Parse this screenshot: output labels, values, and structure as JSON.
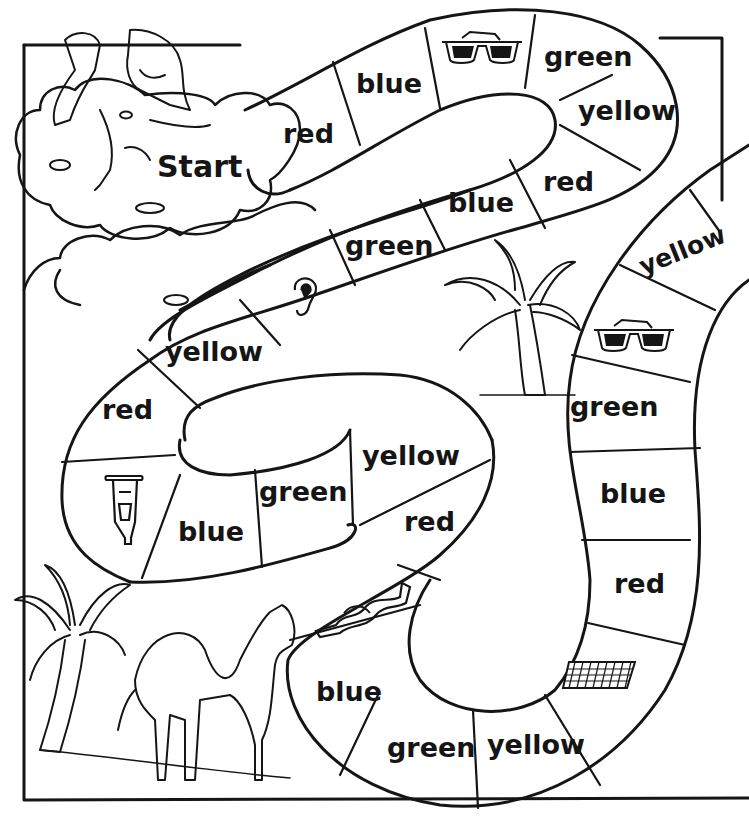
{
  "start_label": "Start",
  "spaces": [
    {
      "index": 1,
      "type": "color",
      "label": "red"
    },
    {
      "index": 2,
      "type": "color",
      "label": "blue"
    },
    {
      "index": 3,
      "type": "picture",
      "icon": "sunglasses-icon"
    },
    {
      "index": 4,
      "type": "color",
      "label": "green"
    },
    {
      "index": 5,
      "type": "color",
      "label": "yellow"
    },
    {
      "index": 6,
      "type": "color",
      "label": "red"
    },
    {
      "index": 7,
      "type": "color",
      "label": "blue"
    },
    {
      "index": 8,
      "type": "color",
      "label": "green"
    },
    {
      "index": 9,
      "type": "picture",
      "icon": "ear-icon"
    },
    {
      "index": 10,
      "type": "color",
      "label": "yellow"
    },
    {
      "index": 11,
      "type": "color",
      "label": "red"
    },
    {
      "index": 12,
      "type": "picture",
      "icon": "crutch-icon"
    },
    {
      "index": 13,
      "type": "color",
      "label": "blue"
    },
    {
      "index": 14,
      "type": "color",
      "label": "green"
    },
    {
      "index": 15,
      "type": "color",
      "label": "yellow"
    },
    {
      "index": 16,
      "type": "color",
      "label": "red"
    },
    {
      "index": 17,
      "type": "picture",
      "icon": "scroll-icon"
    },
    {
      "index": 18,
      "type": "color",
      "label": "blue"
    },
    {
      "index": 19,
      "type": "color",
      "label": "green"
    },
    {
      "index": 20,
      "type": "color",
      "label": "yellow"
    },
    {
      "index": 21,
      "type": "picture",
      "icon": "mat-icon"
    },
    {
      "index": 22,
      "type": "color",
      "label": "red"
    },
    {
      "index": 23,
      "type": "color",
      "label": "blue"
    },
    {
      "index": 24,
      "type": "color",
      "label": "green"
    },
    {
      "index": 25,
      "type": "picture",
      "icon": "sunglasses-icon"
    },
    {
      "index": 26,
      "type": "color",
      "label": "yellow"
    }
  ],
  "illustrations": [
    "girl-on-cloud",
    "palm-tree-top",
    "palm-tree-bottom-left",
    "camel"
  ],
  "colors": {
    "ink": "#151515",
    "paper": "#ffffff"
  }
}
